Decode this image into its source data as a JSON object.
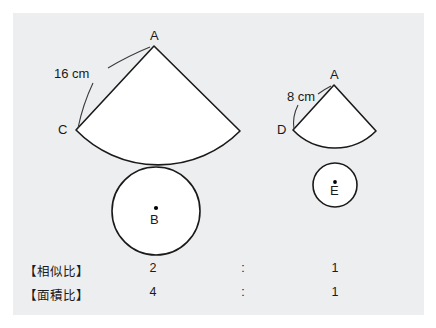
{
  "panel": {
    "background_color": "#edeef0",
    "page_background_color": "#ffffff"
  },
  "diagram": {
    "title": "",
    "stroke_color": "#1a1a1a",
    "fill_color": "#ffffff",
    "large_figure": {
      "name": "large-cone-net",
      "sector_apex_label": "A",
      "sector_radius_endpoint_label": "C",
      "circle_center_label": "B",
      "slant_length_label": "16 cm"
    },
    "small_figure": {
      "name": "small-cone-net",
      "sector_apex_label": "A",
      "sector_radius_endpoint_label": "D",
      "circle_center_label": "E",
      "slant_length_label": "8 cm"
    }
  },
  "ratios": {
    "rows": [
      {
        "name": "【相似比】",
        "left": "2",
        "colon": ":",
        "right": "1"
      },
      {
        "name": "【面積比】",
        "left": "4",
        "colon": ":",
        "right": "1"
      }
    ]
  }
}
